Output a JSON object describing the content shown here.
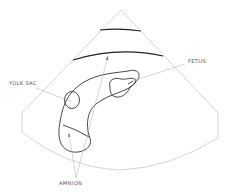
{
  "diagram": {
    "type": "ultrasound-schematic",
    "labels": {
      "yolk_sac": "YOLK SAC",
      "fetus": "FETUS",
      "amnion": "AMNION"
    },
    "colors": {
      "background": "#ffffff",
      "outline": "#333333",
      "scan_sector": "#b8b8b8",
      "label_text": "#555555"
    }
  }
}
